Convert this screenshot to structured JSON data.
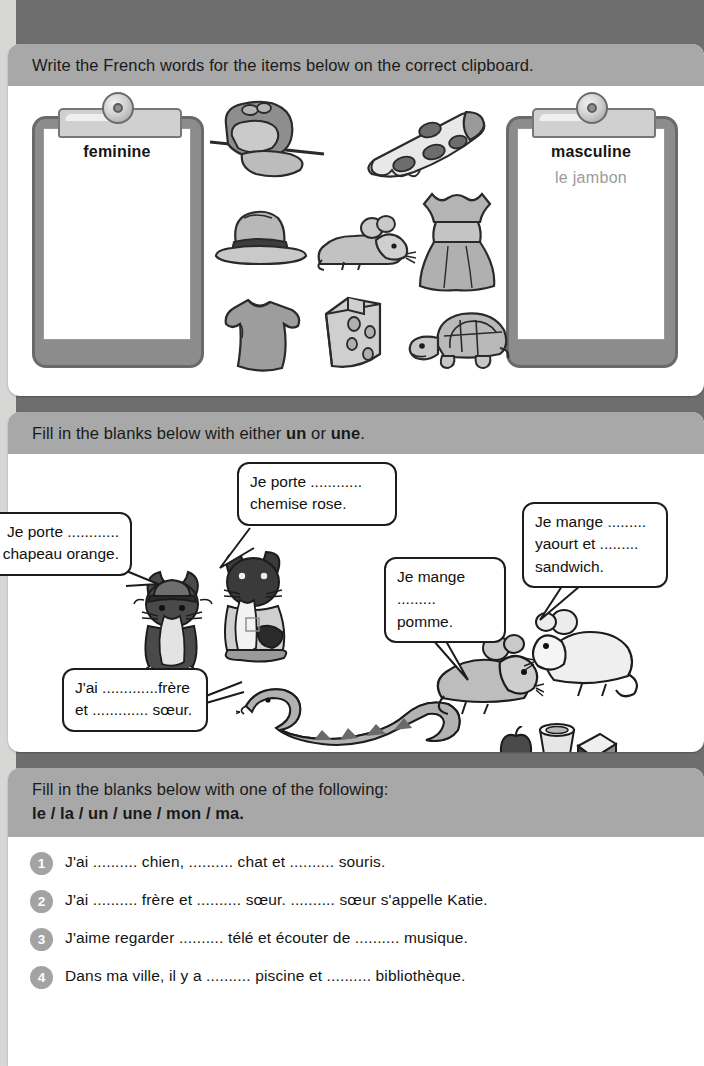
{
  "page": {
    "background_color": "#6e6e6e",
    "paper_color": "#ffffff",
    "header_band_color": "#a8a8a8"
  },
  "sections": [
    {
      "id": "sorting-activity",
      "instruction_parts": [
        {
          "text": "Write the French words for the items below on the correct clipboard.",
          "bold": false
        }
      ],
      "clipboards": [
        {
          "id": "feminine",
          "title": "feminine",
          "answers": []
        },
        {
          "id": "masculine",
          "title": "masculine",
          "answers": [
            "le jambon"
          ]
        }
      ],
      "picture_items": [
        {
          "name": "ham",
          "french": "le jambon"
        },
        {
          "name": "pizza",
          "french": "la pizza"
        },
        {
          "name": "hat",
          "french": "le chapeau"
        },
        {
          "name": "mouse",
          "french": "la souris"
        },
        {
          "name": "dress",
          "french": "la robe"
        },
        {
          "name": "t-shirt",
          "french": "le t-shirt"
        },
        {
          "name": "cheese",
          "french": "le fromage"
        },
        {
          "name": "tortoise",
          "french": "la tortue"
        }
      ]
    },
    {
      "id": "un-une-activity",
      "instruction_parts": [
        {
          "text": "Fill in the blanks below with either ",
          "bold": false
        },
        {
          "text": "un",
          "bold": true
        },
        {
          "text": " or ",
          "bold": false
        },
        {
          "text": "une",
          "bold": true
        },
        {
          "text": ".",
          "bold": false
        }
      ],
      "speech_bubbles": [
        {
          "id": "chemise",
          "speaker": "cat-with-shirt",
          "lines": [
            "Je porte ............",
            "chemise rose."
          ]
        },
        {
          "id": "chapeau",
          "speaker": "cat-with-hat",
          "lines": [
            "Je porte ............",
            "chapeau orange."
          ],
          "clipped_left": true
        },
        {
          "id": "pomme",
          "speaker": "mouse-left",
          "lines": [
            "Je mange",
            "......... pomme."
          ]
        },
        {
          "id": "yaourt",
          "speaker": "mouse-right",
          "lines": [
            "Je mange .........",
            "yaourt et .........",
            "sandwich."
          ]
        },
        {
          "id": "frere",
          "speaker": "snake",
          "lines": [
            "J'ai .............frère",
            "et ............. sœur."
          ]
        }
      ],
      "characters": [
        "cat-with-hat",
        "cat-with-shirt",
        "snake",
        "mouse-left",
        "mouse-right"
      ],
      "props": [
        "apple",
        "yogurt-pot",
        "sandwich"
      ]
    },
    {
      "id": "articles-activity",
      "instruction_parts": [
        {
          "text": "Fill in the blanks below with one of the following:",
          "bold": false
        }
      ],
      "instruction_line2": "le / la / un / une / mon / ma.",
      "questions": [
        {
          "number": "1",
          "text": "J'ai .......... chien, .......... chat et .......... souris."
        },
        {
          "number": "2",
          "text": "J'ai .......... frère et .......... sœur.   .......... sœur s'appelle Katie."
        },
        {
          "number": "3",
          "text": "J'aime regarder .......... télé et écouter de .......... musique."
        },
        {
          "number": "4",
          "text": "Dans ma ville, il y a .......... piscine et .......... bibliothèque."
        }
      ]
    }
  ]
}
